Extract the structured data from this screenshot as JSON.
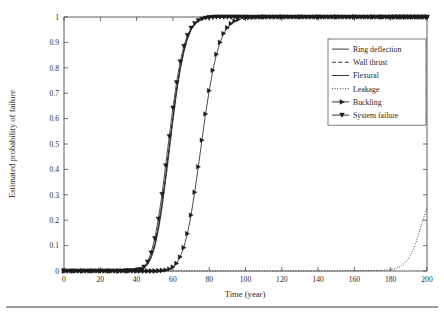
{
  "figure": {
    "background": "#ffffff",
    "foreground": "#1f1f1f",
    "footer_rule": true
  },
  "chart_data": {
    "type": "line",
    "title": "",
    "xlabel": "Time (year)",
    "ylabel": "Estimated probability of failure",
    "xlim": [
      0,
      200
    ],
    "ylim": [
      0,
      1
    ],
    "xticks": [
      0,
      20,
      40,
      60,
      80,
      100,
      120,
      140,
      160,
      180,
      200
    ],
    "xticklabels": [
      "0",
      "20",
      "40",
      "60",
      "80",
      "100",
      "120",
      "140",
      "160",
      "180",
      "200"
    ],
    "yticks": [
      0,
      0.1,
      0.2,
      0.3,
      0.4,
      0.5,
      0.6,
      0.7,
      0.8,
      0.9,
      1
    ],
    "yticklabels": [
      "0",
      "0.1",
      "0.2",
      "0.3",
      "0.4",
      "0.5",
      "0.6",
      "0.7",
      "0.8",
      "0.9",
      "1"
    ],
    "grid": false,
    "legend_position": "upper right",
    "legend_entries": [
      {
        "label": "Ring deflection",
        "style": "solid",
        "marker": "none",
        "color": "#242424"
      },
      {
        "label": "Wall thrust",
        "style": "dashed",
        "marker": "none",
        "color": "#242424"
      },
      {
        "label": "Flexural",
        "style": "solid",
        "marker": "none",
        "color": "#3a3a3a"
      },
      {
        "label": "Leakage",
        "style": "dotted",
        "marker": "none",
        "color": "#242424"
      },
      {
        "label": "Buckling",
        "style": "solid",
        "marker": "triangle-right",
        "color": "#1b1b1b"
      },
      {
        "label": "System failure",
        "style": "solid",
        "marker": "triangle-down",
        "color": "#1b1b1b"
      }
    ],
    "x": [
      0,
      5,
      10,
      15,
      20,
      25,
      30,
      35,
      40,
      42,
      44,
      46,
      48,
      50,
      52,
      54,
      56,
      58,
      60,
      62,
      64,
      66,
      68,
      70,
      72,
      74,
      76,
      78,
      80,
      82,
      84,
      86,
      88,
      90,
      92,
      94,
      96,
      100,
      110,
      120,
      130,
      140,
      150,
      160,
      170,
      175,
      180,
      182,
      184,
      186,
      188,
      190,
      192,
      194,
      196,
      198,
      200
    ],
    "series": [
      {
        "name": "Ring deflection",
        "style": "solid",
        "marker": "none",
        "values": [
          0,
          0,
          0,
          0,
          0,
          0,
          0,
          0,
          0.002,
          0.005,
          0.012,
          0.028,
          0.058,
          0.105,
          0.175,
          0.265,
          0.375,
          0.49,
          0.605,
          0.712,
          0.8,
          0.868,
          0.918,
          0.952,
          0.973,
          0.985,
          0.992,
          0.996,
          0.998,
          0.999,
          1,
          1,
          1,
          1,
          1,
          1,
          1,
          1,
          1,
          1,
          1,
          1,
          1,
          1,
          1,
          1,
          1,
          1,
          1,
          1,
          1,
          1,
          1,
          1,
          1,
          1,
          1
        ]
      },
      {
        "name": "Wall thrust",
        "style": "dashed",
        "marker": "none",
        "values": [
          0,
          0,
          0,
          0,
          0,
          0,
          0,
          0,
          0.002,
          0.005,
          0.012,
          0.028,
          0.058,
          0.105,
          0.175,
          0.265,
          0.375,
          0.49,
          0.605,
          0.712,
          0.8,
          0.868,
          0.918,
          0.952,
          0.973,
          0.985,
          0.992,
          0.996,
          0.998,
          0.999,
          1,
          1,
          1,
          1,
          1,
          1,
          1,
          1,
          1,
          1,
          1,
          1,
          1,
          1,
          1,
          1,
          1,
          1,
          1,
          1,
          1,
          1,
          1,
          1,
          1,
          1,
          1
        ]
      },
      {
        "name": "Flexural",
        "style": "solid",
        "marker": "none",
        "values": [
          0,
          0,
          0,
          0,
          0,
          0,
          0,
          0,
          0.001,
          0.004,
          0.01,
          0.024,
          0.05,
          0.094,
          0.16,
          0.248,
          0.356,
          0.472,
          0.59,
          0.7,
          0.79,
          0.86,
          0.912,
          0.948,
          0.97,
          0.983,
          0.991,
          0.995,
          0.998,
          0.999,
          1,
          1,
          1,
          1,
          1,
          1,
          1,
          1,
          1,
          1,
          1,
          1,
          1,
          1,
          1,
          1,
          1,
          1,
          1,
          1,
          1,
          1,
          1,
          1,
          1,
          1,
          1
        ]
      },
      {
        "name": "Leakage",
        "style": "dotted",
        "marker": "none",
        "values": [
          0,
          0,
          0,
          0,
          0,
          0,
          0,
          0,
          0,
          0,
          0,
          0,
          0,
          0,
          0,
          0,
          0,
          0,
          0,
          0,
          0,
          0,
          0,
          0,
          0,
          0,
          0,
          0,
          0,
          0,
          0,
          0,
          0,
          0,
          0,
          0,
          0,
          0,
          0,
          0,
          0,
          0,
          0,
          0.001,
          0.002,
          0.003,
          0.005,
          0.008,
          0.013,
          0.021,
          0.033,
          0.051,
          0.077,
          0.113,
          0.159,
          0.205,
          0.25
        ]
      },
      {
        "name": "Buckling",
        "style": "solid",
        "marker": "triangle-right",
        "values": [
          0,
          0,
          0,
          0,
          0,
          0,
          0,
          0,
          0,
          0,
          0,
          0,
          0,
          0,
          0.001,
          0.002,
          0.004,
          0.008,
          0.016,
          0.03,
          0.055,
          0.092,
          0.147,
          0.22,
          0.31,
          0.41,
          0.515,
          0.618,
          0.71,
          0.79,
          0.853,
          0.9,
          0.935,
          0.958,
          0.974,
          0.984,
          0.99,
          0.997,
          1,
          1,
          1,
          1,
          1,
          1,
          1,
          1,
          1,
          1,
          1,
          1,
          1,
          1,
          1,
          1,
          1,
          1,
          1
        ]
      },
      {
        "name": "System failure",
        "style": "solid",
        "marker": "triangle-down",
        "values": [
          0,
          0,
          0,
          0,
          0,
          0,
          0,
          0.001,
          0.003,
          0.007,
          0.016,
          0.036,
          0.072,
          0.128,
          0.205,
          0.302,
          0.415,
          0.53,
          0.642,
          0.742,
          0.824,
          0.885,
          0.928,
          0.957,
          0.975,
          0.986,
          0.992,
          0.996,
          0.998,
          0.999,
          1,
          1,
          1,
          1,
          1,
          1,
          1,
          1,
          1,
          1,
          1,
          1,
          1,
          1,
          1,
          1,
          1,
          1,
          1,
          1,
          1,
          1,
          1,
          1,
          1,
          1,
          1
        ]
      }
    ]
  }
}
